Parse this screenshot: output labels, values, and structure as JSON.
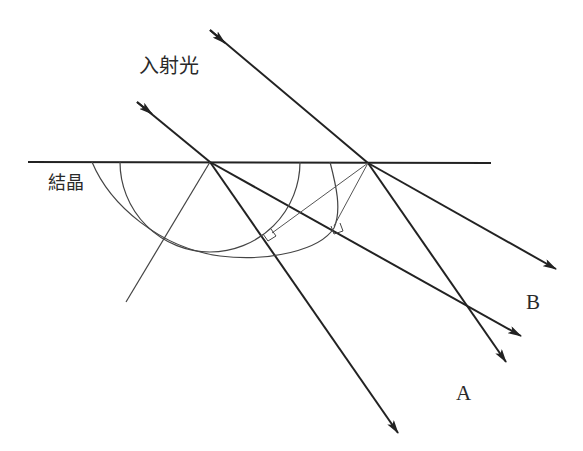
{
  "labels": {
    "incident_light": "入射光",
    "crystal": "結晶",
    "ray_a": "A",
    "ray_b": "B"
  },
  "colors": {
    "ray": "#222222",
    "construction": "#555555",
    "text": "#2a2a2a",
    "background": "#ffffff"
  },
  "diagram": {
    "elements": [
      "crystal-surface",
      "incident-ray-left",
      "incident-ray-right",
      "refracted-ray-a-left",
      "refracted-ray-b-left",
      "refracted-ray-a-right",
      "refracted-ray-b-right",
      "circular-wavefront",
      "elliptical-wavefront",
      "tangent-lines",
      "right-angle-markers"
    ]
  }
}
